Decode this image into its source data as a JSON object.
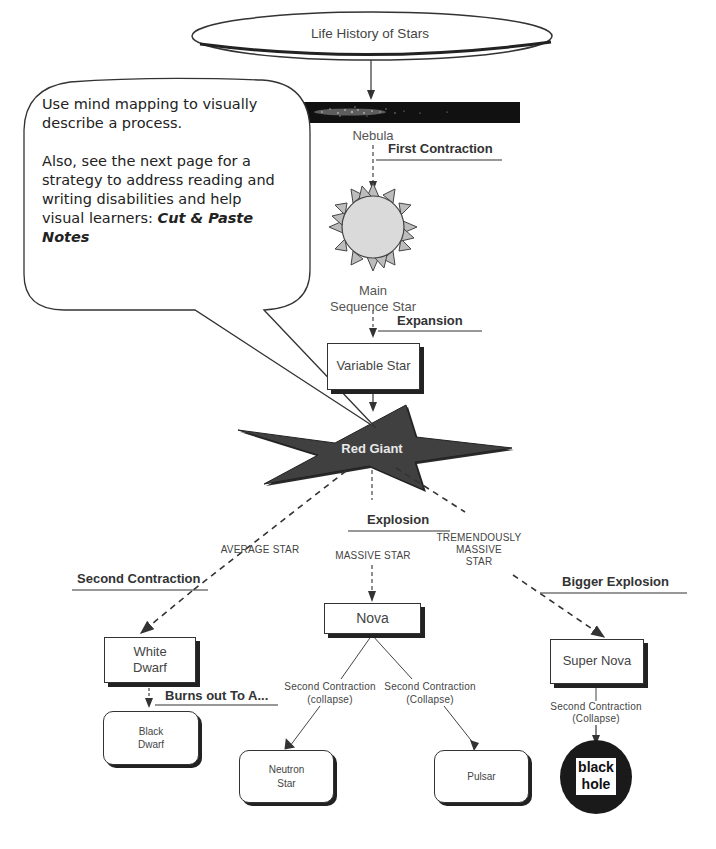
{
  "title": "Life History of Stars",
  "callout": {
    "paragraph1": "Use mind mapping to visually describe a process.",
    "paragraph2_prefix": "Also, see the next page for a strategy to address reading and writing disabilities and help visual learners: ",
    "paragraph2_emphasis": "Cut & Paste Notes"
  },
  "nodes": {
    "nebula": "Nebula",
    "main_sequence_line1": "Main",
    "main_sequence_line2": "Sequence Star",
    "variable_star": "Variable Star",
    "red_giant": "Red Giant",
    "white_dwarf_line1": "White",
    "white_dwarf_line2": "Dwarf",
    "black_dwarf_line1": "Black",
    "black_dwarf_line2": "Dwarf",
    "nova": "Nova",
    "neutron_star_line1": "Neutron",
    "neutron_star_line2": "Star",
    "pulsar": "Pulsar",
    "super_nova": "Super Nova",
    "black_hole_line1": "black",
    "black_hole_line2": "hole"
  },
  "stages": {
    "first_contraction": "First Contraction",
    "expansion": "Expansion",
    "explosion": "Explosion",
    "second_contraction": "Second Contraction",
    "bigger_explosion": "Bigger Explosion",
    "burns_out": "Burns out To A..."
  },
  "branches": {
    "average_star": "AVERAGE STAR",
    "massive_star": "MASSIVE STAR",
    "tremendously_line1": "TREMENDOUSLY",
    "tremendously_line2": "MASSIVE",
    "tremendously_line3": "STAR"
  },
  "edge_labels": {
    "nova_left_line1": "Second Contraction",
    "nova_left_line2": "(collapse)",
    "nova_right_line1": "Second Contraction",
    "nova_right_line2": "(Collapse)",
    "supernova_line1": "Second Contraction",
    "supernova_line2": "(Collapse)"
  },
  "colors": {
    "line": "#333333",
    "red_giant_fill": "#3a3a3a",
    "sun_fill": "#d8d8d8",
    "sun_rays": "#b8b8b8",
    "black_hole": "#1a1a1a"
  }
}
